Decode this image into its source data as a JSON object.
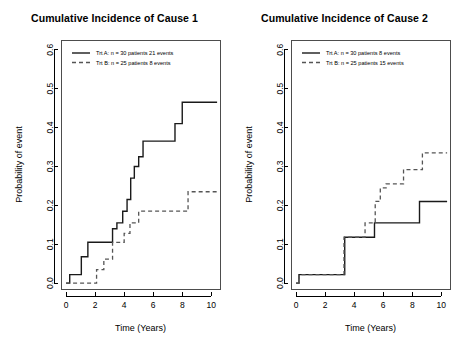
{
  "figure": {
    "width": 459,
    "height": 363,
    "background": "#ffffff",
    "foreground": "#000000"
  },
  "chart_data": [
    {
      "type": "line",
      "panel_id": "cause-1",
      "title": "Cumulative Incidence of Cause 1",
      "xlabel": "Time (Years)",
      "ylabel": "Probability of event",
      "xlim": [
        -0.35,
        10.6
      ],
      "ylim": [
        -0.015,
        0.625
      ],
      "xticks": [
        0,
        2,
        4,
        6,
        8,
        10
      ],
      "xtick_labels": [
        "0",
        "2",
        "4",
        "6",
        "8",
        "10"
      ],
      "yticks": [
        0.0,
        0.1,
        0.2,
        0.3,
        0.4,
        0.5,
        0.6
      ],
      "ytick_labels": [
        "0.0",
        "0.1",
        "0.2",
        "0.3",
        "0.4",
        "0.5",
        "0.6"
      ],
      "grid": false,
      "step_type": "post",
      "legend": {
        "position": "top-left",
        "entries": [
          {
            "label": "Trt A: n = 30 patients 21 events",
            "style": "solid",
            "color": "#1a1a1a"
          },
          {
            "label": "Trt B: n = 25 patients 8 events",
            "style": "dashed",
            "color": "#555555"
          }
        ]
      },
      "series": [
        {
          "name": "Trt A",
          "style": "solid",
          "color": "#1a1a1a",
          "n_patients": 30,
          "n_events": 21,
          "x": [
            0.0,
            0.25,
            0.55,
            1.05,
            1.5,
            2.5,
            3.2,
            3.5,
            3.9,
            4.2,
            4.45,
            4.7,
            5.0,
            5.3,
            6.0,
            7.5,
            8.0,
            10.4
          ],
          "y": [
            0.0,
            0.022,
            0.022,
            0.068,
            0.105,
            0.105,
            0.14,
            0.155,
            0.185,
            0.215,
            0.27,
            0.3,
            0.325,
            0.365,
            0.365,
            0.41,
            0.465,
            0.465
          ]
        },
        {
          "name": "Trt B",
          "style": "dashed",
          "color": "#555555",
          "n_patients": 25,
          "n_events": 8,
          "x": [
            0.0,
            1.5,
            2.1,
            2.6,
            3.2,
            3.6,
            4.0,
            4.4,
            5.0,
            8.0,
            8.4,
            10.4
          ],
          "y": [
            0.0,
            0.0,
            0.035,
            0.062,
            0.105,
            0.105,
            0.128,
            0.155,
            0.185,
            0.185,
            0.235,
            0.235
          ]
        }
      ]
    },
    {
      "type": "line",
      "panel_id": "cause-2",
      "title": "Cumulative Incidence of Cause 2",
      "xlabel": "Time (Years)",
      "ylabel": "Probability of event",
      "xlim": [
        -0.35,
        10.6
      ],
      "ylim": [
        -0.015,
        0.625
      ],
      "xticks": [
        0,
        2,
        4,
        6,
        8,
        10
      ],
      "xtick_labels": [
        "0",
        "2",
        "4",
        "6",
        "8",
        "10"
      ],
      "yticks": [
        0.0,
        0.1,
        0.2,
        0.3,
        0.4,
        0.5,
        0.6
      ],
      "ytick_labels": [
        "0.0",
        "0.1",
        "0.2",
        "0.3",
        "0.4",
        "0.5",
        "0.6"
      ],
      "grid": false,
      "step_type": "post",
      "legend": {
        "position": "top-left",
        "entries": [
          {
            "label": "Trt A: n = 30 patients 8 events",
            "style": "solid",
            "color": "#1a1a1a"
          },
          {
            "label": "Trt B: n = 25 patients 15 events",
            "style": "dashed",
            "color": "#555555"
          }
        ]
      },
      "series": [
        {
          "name": "Trt A",
          "style": "solid",
          "color": "#1a1a1a",
          "n_patients": 30,
          "n_events": 8,
          "x": [
            0.0,
            0.2,
            0.45,
            3.1,
            3.35,
            5.1,
            5.4,
            8.2,
            8.5,
            10.4
          ],
          "y": [
            0.0,
            0.022,
            0.022,
            0.022,
            0.118,
            0.118,
            0.155,
            0.155,
            0.21,
            0.21
          ]
        },
        {
          "name": "Trt B",
          "style": "dashed",
          "color": "#555555",
          "n_patients": 25,
          "n_events": 15,
          "x": [
            0.0,
            0.2,
            0.45,
            3.0,
            3.3,
            4.4,
            4.75,
            5.1,
            5.45,
            5.8,
            6.2,
            7.0,
            7.4,
            8.3,
            8.7,
            10.4
          ],
          "y": [
            0.0,
            0.022,
            0.022,
            0.022,
            0.118,
            0.118,
            0.155,
            0.155,
            0.21,
            0.245,
            0.255,
            0.255,
            0.292,
            0.292,
            0.335,
            0.335
          ]
        }
      ]
    }
  ]
}
